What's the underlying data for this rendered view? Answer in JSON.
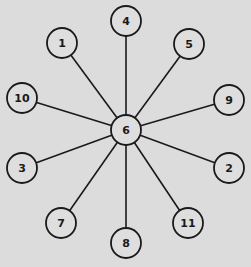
{
  "diagram": {
    "type": "star-graph",
    "background": "#dcdcdc",
    "stroke_color": "#1a1a1a",
    "center": {
      "id": "6",
      "label": "6",
      "x": 126,
      "y": 130,
      "r": 15
    },
    "nodes": [
      {
        "id": "4",
        "label": "4",
        "x": 126,
        "y": 21,
        "r": 15
      },
      {
        "id": "1",
        "label": "1",
        "x": 62,
        "y": 43,
        "r": 15
      },
      {
        "id": "5",
        "label": "5",
        "x": 189,
        "y": 44,
        "r": 15
      },
      {
        "id": "10",
        "label": "10",
        "x": 22,
        "y": 98,
        "r": 15
      },
      {
        "id": "9",
        "label": "9",
        "x": 229,
        "y": 100,
        "r": 15
      },
      {
        "id": "3",
        "label": "3",
        "x": 22,
        "y": 168,
        "r": 15
      },
      {
        "id": "2",
        "label": "2",
        "x": 229,
        "y": 168,
        "r": 15
      },
      {
        "id": "7",
        "label": "7",
        "x": 61,
        "y": 223,
        "r": 15
      },
      {
        "id": "11",
        "label": "11",
        "x": 188,
        "y": 223,
        "r": 15
      },
      {
        "id": "8",
        "label": "8",
        "x": 126,
        "y": 243,
        "r": 15
      }
    ],
    "edges": [
      [
        "6",
        "4"
      ],
      [
        "6",
        "1"
      ],
      [
        "6",
        "5"
      ],
      [
        "6",
        "10"
      ],
      [
        "6",
        "9"
      ],
      [
        "6",
        "3"
      ],
      [
        "6",
        "2"
      ],
      [
        "6",
        "7"
      ],
      [
        "6",
        "11"
      ],
      [
        "6",
        "8"
      ]
    ]
  }
}
